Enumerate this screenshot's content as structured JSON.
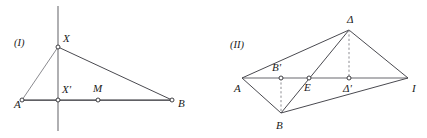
{
  "figures": [
    {
      "id": "figure-one",
      "caption": "(I)",
      "caption_pos": {
        "x": 14,
        "y": 46
      },
      "points": [
        {
          "name": "A",
          "label": "A",
          "x": 22,
          "y": 100,
          "lx": 14,
          "ly": 108,
          "marker": true
        },
        {
          "name": "X",
          "label": "X",
          "x": 58,
          "y": 47,
          "lx": 63,
          "ly": 42,
          "marker": true
        },
        {
          "name": "Xp",
          "label": "X'",
          "x": 58,
          "y": 100,
          "lx": 62,
          "ly": 93,
          "marker": true
        },
        {
          "name": "M",
          "label": "M",
          "x": 98,
          "y": 100,
          "lx": 93,
          "ly": 92,
          "marker": true
        },
        {
          "name": "B",
          "label": "B",
          "x": 172,
          "y": 100,
          "lx": 178,
          "ly": 107,
          "marker": true
        }
      ],
      "segments": [
        {
          "name": "segment-AB",
          "from": "A",
          "to": "B",
          "style": "seg-dark"
        },
        {
          "name": "segment-AX",
          "from": "A",
          "to": "X",
          "style": "seg-thin"
        },
        {
          "name": "segment-XB",
          "from": "X",
          "to": "B",
          "style": "seg-mid"
        }
      ],
      "vertical_line": {
        "name": "vertical-axis-through-X",
        "x": 58,
        "y1": 6,
        "y2": 131,
        "style": "seg-vert"
      }
    },
    {
      "id": "figure-two",
      "caption": "(II)",
      "caption_pos": {
        "x": 230,
        "y": 48
      },
      "points": [
        {
          "name": "A",
          "label": "A",
          "x": 242,
          "y": 78,
          "lx": 234,
          "ly": 92,
          "marker": false
        },
        {
          "name": "Bprime",
          "label": "B'",
          "x": 281,
          "y": 78,
          "lx": 272,
          "ly": 71,
          "marker": true
        },
        {
          "name": "E",
          "label": "E",
          "x": 309,
          "y": 78,
          "lx": 304,
          "ly": 91,
          "marker": true
        },
        {
          "name": "Dprime",
          "label": "Δ'",
          "x": 349,
          "y": 78,
          "lx": 343,
          "ly": 92,
          "marker": true
        },
        {
          "name": "Gamma",
          "label": "Ι",
          "x": 408,
          "y": 78,
          "lx": 412,
          "ly": 92,
          "marker": false
        },
        {
          "name": "Delta",
          "label": "Δ",
          "x": 349,
          "y": 30,
          "lx": 347,
          "ly": 23,
          "marker": false
        },
        {
          "name": "B",
          "label": "B",
          "x": 281,
          "y": 113,
          "lx": 276,
          "ly": 129,
          "marker": false
        }
      ],
      "segments": [
        {
          "name": "segment-A-Gamma",
          "from": "A",
          "to": "Gamma",
          "style": "seg-axis"
        },
        {
          "name": "segment-A-Delta",
          "from": "A",
          "to": "Delta",
          "style": "seg-mid"
        },
        {
          "name": "segment-Delta-Gamma",
          "from": "Delta",
          "to": "Gamma",
          "style": "seg-mid"
        },
        {
          "name": "segment-A-B",
          "from": "A",
          "to": "B",
          "style": "seg-mid"
        },
        {
          "name": "segment-B-Gamma",
          "from": "B",
          "to": "Gamma",
          "style": "seg-mid"
        },
        {
          "name": "segment-B-Delta",
          "from": "B",
          "to": "Delta",
          "style": "seg-mid"
        }
      ],
      "dashed_segments": [
        {
          "name": "altitude-Bprime-to-B",
          "from": "Bprime",
          "to": "B",
          "style": "seg-dash"
        },
        {
          "name": "altitude-Delta-to-Dprime",
          "from": "Delta",
          "to": "Dprime",
          "style": "seg-dash"
        }
      ]
    }
  ],
  "colors": {
    "background": "#ffffff",
    "line_dark": "#2b2b30",
    "line_mid": "#4a4a50",
    "line_thin": "#7d7d82",
    "line_axis": "#9a9a9e",
    "label_text": "#1a1a1a"
  }
}
